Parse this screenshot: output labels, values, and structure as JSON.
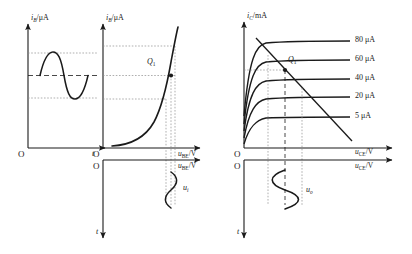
{
  "figure": {
    "stroke_color": "#1a1a1a",
    "grid_color": "#9a9a9a"
  },
  "left_panel": {
    "waveform_plot": {
      "y_axis_label_main": "i",
      "y_axis_label_sub": "B",
      "y_axis_label_unit": "/μA",
      "origin_label": "O",
      "x_axis_label": "t",
      "description": "base current i_B versus time, sinusoidal"
    },
    "input_characteristic": {
      "y_axis_label_main": "i",
      "y_axis_label_sub": "B",
      "y_axis_label_unit": "/μA",
      "x_axis_label_main": "u",
      "x_axis_label_sub": "BE",
      "x_axis_label_unit": "/V",
      "origin_label": "O",
      "q_point_label_main": "Q",
      "q_point_label_sub": "1",
      "description": "exponential input characteristic curve of BJT"
    },
    "input_waveform": {
      "x_axis_label_main": "u",
      "x_axis_label_sub": "BE",
      "x_axis_label_unit": "/V",
      "origin_label": "O",
      "y_axis_label": "t",
      "signal_label_main": "u",
      "signal_label_sub": "i",
      "description": "input voltage u_i drawn vertically versus time"
    }
  },
  "right_panel": {
    "output_characteristic": {
      "y_axis_label_main": "i",
      "y_axis_label_sub": "C",
      "y_axis_label_unit": "/mA",
      "x_axis_label_main": "u",
      "x_axis_label_sub": "CE",
      "x_axis_label_unit": "/V",
      "origin_label": "O",
      "q_point_label_main": "Q",
      "q_point_label_sub": "1",
      "curve_labels": [
        "80 μA",
        "60 μA",
        "40 μA",
        "20 μA",
        "5 μA"
      ],
      "description": "family of output characteristics with DC load line"
    },
    "output_waveform": {
      "x_axis_label_main": "u",
      "x_axis_label_sub": "CE",
      "x_axis_label_unit": "/V",
      "origin_label": "O",
      "y_axis_label": "t",
      "signal_label_main": "u",
      "signal_label_sub": "o",
      "description": "output voltage u_o drawn vertically versus time"
    }
  }
}
